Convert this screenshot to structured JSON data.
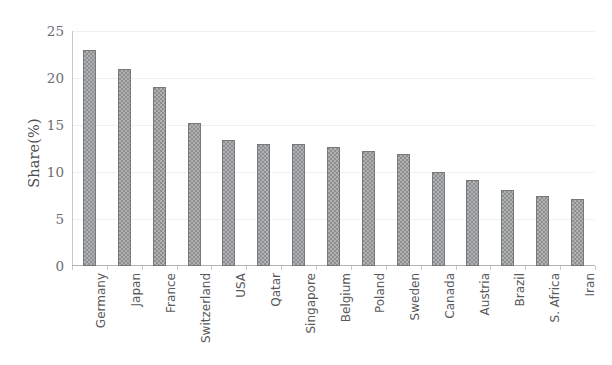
{
  "chart_data": {
    "type": "bar",
    "title": "",
    "xlabel": "",
    "ylabel": "Share(%)",
    "ylim": [
      0,
      25
    ],
    "yticks": [
      0,
      5,
      10,
      15,
      20,
      25
    ],
    "ytick_labels": [
      "0",
      "5",
      "10",
      "15",
      "20",
      "25"
    ],
    "grid": true,
    "legend": "none",
    "categories": [
      "Germany",
      "Japan",
      "France",
      "Switzerland",
      "USA",
      "Qatar",
      "Singapore",
      "Belgium",
      "Poland",
      "Sweden",
      "Canada",
      "Austria",
      "Brazil",
      "S. Africa",
      "Iran"
    ],
    "values": [
      23.0,
      21.0,
      19.0,
      15.2,
      13.4,
      13.0,
      13.0,
      12.7,
      12.2,
      11.9,
      10.0,
      9.1,
      8.1,
      7.4,
      7.1
    ],
    "bar_color": "#8d8f91",
    "bar_border_color": "#76787a",
    "gridline_color": "#f0f0f0",
    "axis_color": "#b3b3b3",
    "text_color": "#58595b"
  }
}
